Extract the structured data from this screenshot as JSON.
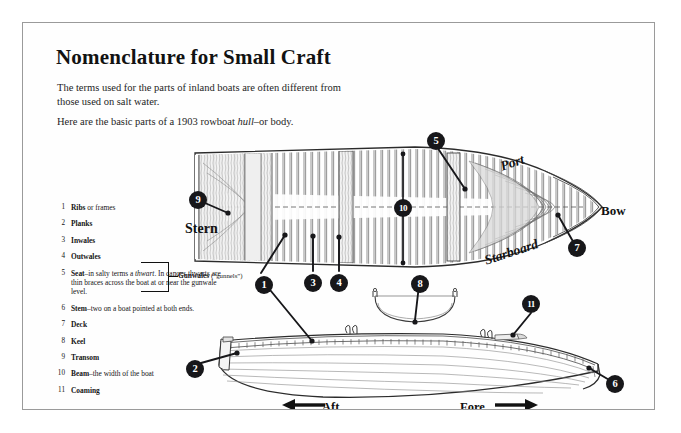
{
  "page": {
    "title": "Nomenclature for Small Craft",
    "intro_1": "The terms used for the parts of inland boats are often different from those used on salt water.",
    "intro_2_a": "Here are the basic parts of a 1903 rowboat ",
    "intro_2_em": "hull",
    "intro_2_b": "–or body."
  },
  "legend": {
    "items": [
      {
        "num": "1",
        "bold": "Ribs",
        "rest": " or frames"
      },
      {
        "num": "2",
        "bold": "Planks",
        "rest": ""
      },
      {
        "num": "3",
        "bold": "Inwales",
        "rest": ""
      },
      {
        "num": "4",
        "bold": "Outwales",
        "rest": ""
      },
      {
        "num": "5",
        "bold": "Seat",
        "rest": "–in salty terms a ",
        "em": "thwart",
        "rest2": ". In canoes thwarts are thin braces across the boat at or near the gunwale level."
      },
      {
        "num": "6",
        "bold": "Stem",
        "rest": "–two on a boat pointed at both ends."
      },
      {
        "num": "7",
        "bold": "Deck",
        "rest": ""
      },
      {
        "num": "8",
        "bold": "Keel",
        "rest": ""
      },
      {
        "num": "9",
        "bold": "Transom",
        "rest": ""
      },
      {
        "num": "10",
        "bold": "Beam",
        "rest": "–the width of the boat"
      },
      {
        "num": "11",
        "bold": "Coaming",
        "rest": ""
      }
    ],
    "brace_label_bold": "Gunwales",
    "brace_label_rest": " (“gunnels”)"
  },
  "diagram": {
    "labels": {
      "stern": "Stern",
      "bow": "Bow",
      "port": "Port",
      "starboard": "Starboard",
      "aft": "Aft",
      "fore": "Fore"
    },
    "callouts": [
      {
        "id": "c1",
        "label": "1",
        "x": 232,
        "y": 253
      },
      {
        "id": "c2",
        "label": "2",
        "x": 163,
        "y": 337
      },
      {
        "id": "c3",
        "label": "3",
        "x": 281,
        "y": 251
      },
      {
        "id": "c4",
        "label": "4",
        "x": 307,
        "y": 251
      },
      {
        "id": "c5",
        "label": "5",
        "x": 404,
        "y": 109
      },
      {
        "id": "c6",
        "label": "6",
        "x": 592,
        "y": 364
      },
      {
        "id": "c7",
        "label": "7",
        "x": 549,
        "y": 224
      },
      {
        "id": "c8",
        "label": "8",
        "x": 396,
        "y": 252
      },
      {
        "id": "c9",
        "label": "9",
        "x": 166,
        "y": 168
      },
      {
        "id": "c10",
        "label": "10",
        "x": 371,
        "y": 180
      },
      {
        "id": "c11",
        "label": "11",
        "x": 505,
        "y": 279
      }
    ]
  },
  "colors": {
    "ink": "#17171a",
    "border": "#9a9a9a",
    "paper": "#fefefe",
    "line": "#2b2b2b"
  }
}
